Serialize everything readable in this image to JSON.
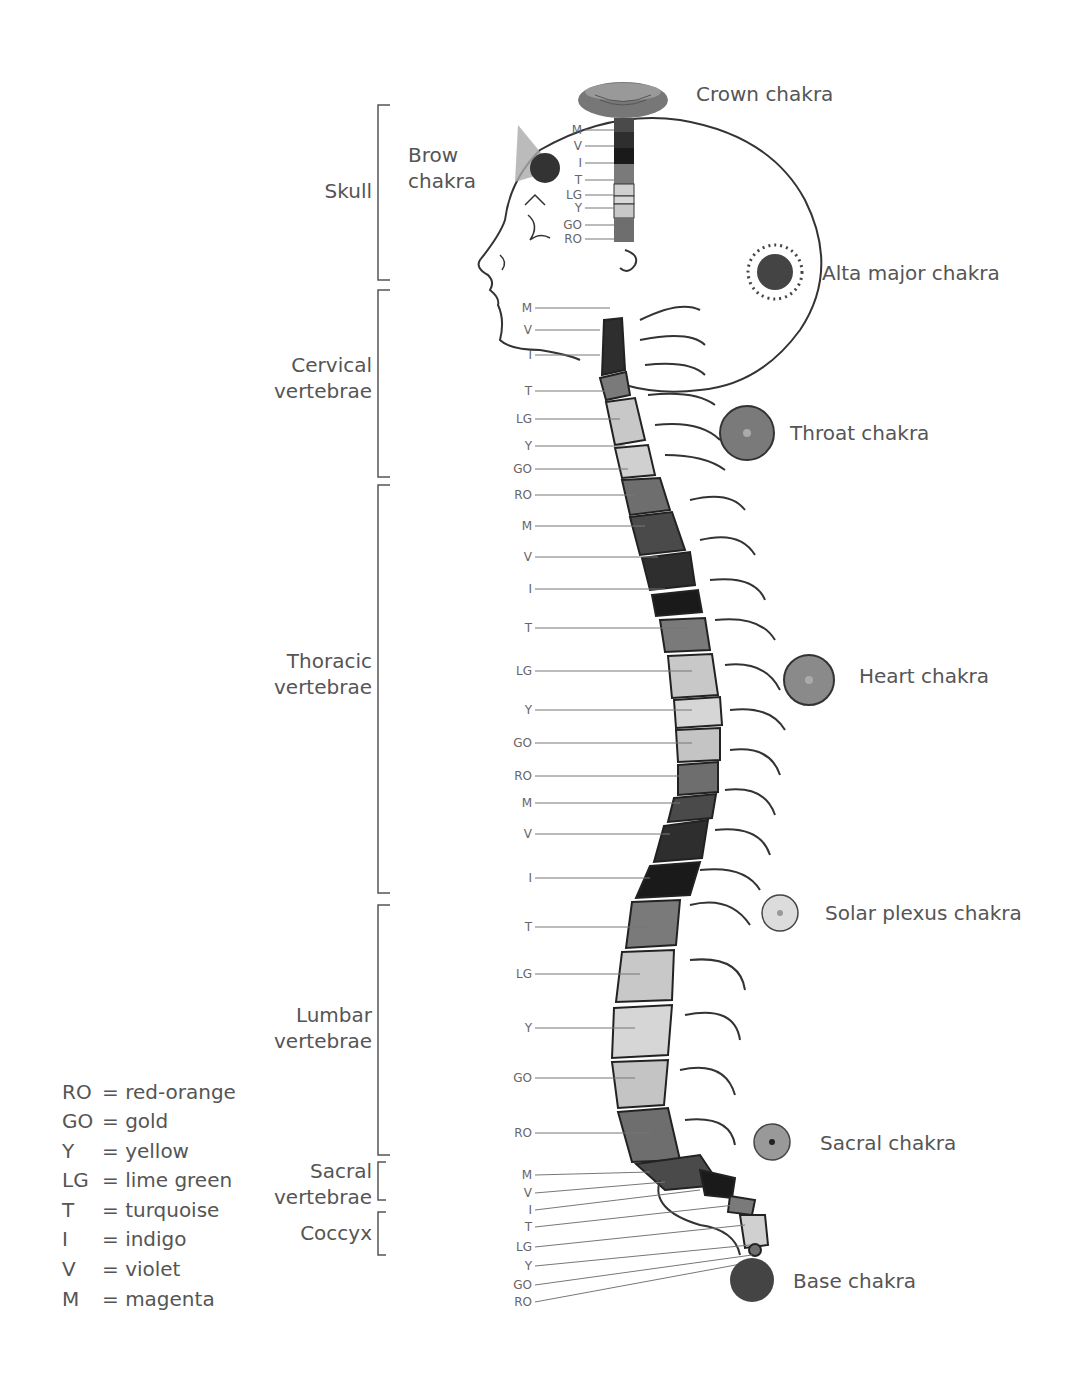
{
  "regions": [
    {
      "id": "skull",
      "label": "Skull"
    },
    {
      "id": "cervical",
      "label": "Cervical\nvertebrae"
    },
    {
      "id": "thoracic",
      "label": "Thoracic\nvertebrae"
    },
    {
      "id": "lumbar",
      "label": "Lumbar\nvertebrae"
    },
    {
      "id": "sacral",
      "label": "Sacral\nvertebrae"
    },
    {
      "id": "coccyx",
      "label": "Coccyx"
    }
  ],
  "chakras": [
    {
      "id": "crown",
      "label": "Crown chakra"
    },
    {
      "id": "brow",
      "label": "Brow\nchakra"
    },
    {
      "id": "alta_major",
      "label": "Alta major chakra"
    },
    {
      "id": "throat",
      "label": "Throat chakra"
    },
    {
      "id": "heart",
      "label": "Heart chakra"
    },
    {
      "id": "solar_plexus",
      "label": "Solar plexus chakra"
    },
    {
      "id": "sacral",
      "label": "Sacral chakra"
    },
    {
      "id": "base",
      "label": "Base chakra"
    }
  ],
  "skull_levels": [
    "M",
    "V",
    "I",
    "T",
    "LG",
    "Y",
    "GO",
    "RO"
  ],
  "cervical_levels": [
    "M",
    "V",
    "I",
    "T",
    "LG",
    "Y",
    "GO"
  ],
  "thoracic_levels": [
    "RO",
    "M",
    "V",
    "I",
    "T",
    "LG",
    "Y",
    "GO",
    "RO",
    "M",
    "V",
    "I"
  ],
  "lumbar_levels": [
    "T",
    "LG",
    "Y",
    "GO",
    "RO"
  ],
  "sacral_coccyx_levels": [
    "M",
    "V",
    "I",
    "T",
    "LG",
    "Y",
    "GO",
    "RO"
  ],
  "legend": [
    {
      "abbr": "RO",
      "eq": "=",
      "name": "red-orange"
    },
    {
      "abbr": "GO",
      "eq": "=",
      "name": "gold"
    },
    {
      "abbr": "Y",
      "eq": "=",
      "name": "yellow"
    },
    {
      "abbr": "LG",
      "eq": "=",
      "name": "lime green"
    },
    {
      "abbr": "T",
      "eq": "=",
      "name": "turquoise"
    },
    {
      "abbr": "I",
      "eq": "=",
      "name": "indigo"
    },
    {
      "abbr": "V",
      "eq": "=",
      "name": "violet"
    },
    {
      "abbr": "M",
      "eq": "=",
      "name": "magenta"
    }
  ],
  "shade_colors": {
    "M": "#4a4a4a",
    "V": "#2e2e2e",
    "I": "#1a1a1a",
    "T": "#7a7a7a",
    "LG": "#c8c8c8",
    "Y": "#d6d6d6",
    "GO": "#c4c4c4",
    "RO": "#6e6e6e"
  }
}
